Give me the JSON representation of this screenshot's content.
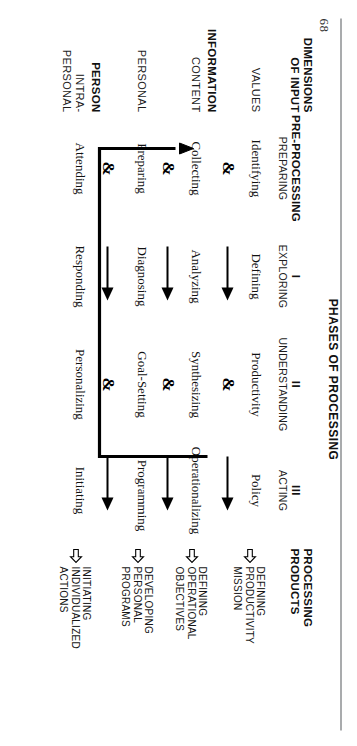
{
  "page": {
    "folio": "68",
    "figure_title": "PHASES OF PROCESSING"
  },
  "header": {
    "dimensions_label_line1": "DIMENSIONS",
    "dimensions_label_line2": "OF INPUT",
    "columns": [
      {
        "roman": "",
        "strong": "PRE-PROCESSING",
        "caps": "PREPARING"
      },
      {
        "roman": "I",
        "strong": "",
        "caps": "EXPLORING"
      },
      {
        "roman": "II",
        "strong": "",
        "caps": "UNDERSTANDING"
      },
      {
        "roman": "III",
        "strong": "",
        "caps": "ACTING"
      }
    ],
    "products_label_line1": "PROCESSING",
    "products_label_line2": "PRODUCTS"
  },
  "rows": [
    {
      "dimension_major": "",
      "dimension_minor": "VALUES",
      "pre_processing": "Identifying",
      "exploring": "Defining",
      "understanding": "Productivity",
      "acting": "Policy",
      "product": {
        "line1": "DEFINING",
        "line2": "PRODUCTIVITY",
        "line3": "MISSION"
      }
    },
    {
      "dimension_major": "INFORMATION",
      "dimension_minor": "CONTENT",
      "pre_processing": "Collecting",
      "exploring": "Analyzing",
      "understanding": "Synthesizing",
      "acting": "Operationalizing",
      "product": {
        "line1": "DEFINING",
        "line2": "OPERATIONAL",
        "line3": "OBJECTIVES"
      }
    },
    {
      "dimension_major": "",
      "dimension_minor": "PERSONAL",
      "pre_processing": "Preparing",
      "exploring": "Diagnosing",
      "understanding": "Goal-Setting",
      "acting": "Programming",
      "product": {
        "line1": "DEVELOPING",
        "line2": "PERSONAL",
        "line3": "PROGRAMS"
      }
    },
    {
      "dimension_major": "PERSON",
      "dimension_minor": "INTRA-\nPERSONAL",
      "dimension_minor_l1": "INTRA-",
      "dimension_minor_l2": "PERSONAL",
      "pre_processing": "Attending",
      "exploring": "Responding",
      "understanding": "Personalizing",
      "acting": "Initiating",
      "product": {
        "line1": "INITIATING",
        "line2": "INDIVIDUALIZED",
        "line3": "ACTIONS"
      }
    }
  ],
  "glyphs": {
    "ampersand": "&",
    "solid_arrow": "solid-right-arrow",
    "hollow_arrow": "hollow-right-arrow"
  },
  "colors": {
    "ink": "#111111",
    "rule": "#55595C",
    "paper": "#FFFFFF"
  }
}
